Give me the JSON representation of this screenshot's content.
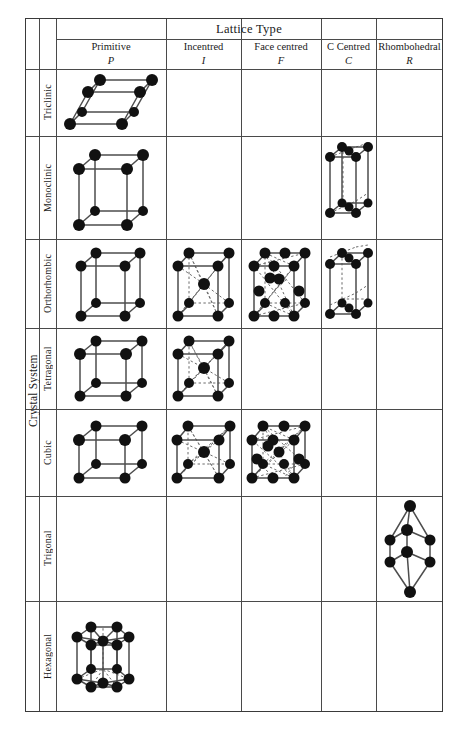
{
  "figure": {
    "header_span_label": "Lattice Type",
    "row_group_label": "Crystal System"
  },
  "columns": [
    {
      "name": "Primitive",
      "symbol": "P"
    },
    {
      "name": "Incentred",
      "symbol": "I"
    },
    {
      "name": "Face centred",
      "symbol": "F"
    },
    {
      "name": "C Centred",
      "symbol": "C"
    },
    {
      "name": "Rhombohedral",
      "symbol": "R"
    }
  ],
  "rows": [
    {
      "label": "Triclinic",
      "cells": [
        "triclinic-p",
        "",
        "",
        "",
        ""
      ]
    },
    {
      "label": "Monoclinic",
      "cells": [
        "monoclinic-p",
        "",
        "",
        "monoclinic-c",
        ""
      ]
    },
    {
      "label": "Orthorhombic",
      "cells": [
        "orthorhombic-p",
        "orthorhombic-i",
        "orthorhombic-f",
        "orthorhombic-c",
        ""
      ]
    },
    {
      "label": "Tetragonal",
      "cells": [
        "tetragonal-p",
        "tetragonal-i",
        "",
        "",
        ""
      ]
    },
    {
      "label": "Cubic",
      "cells": [
        "cubic-p",
        "cubic-i",
        "cubic-f",
        "",
        ""
      ]
    },
    {
      "label": "Trigonal",
      "cells": [
        "",
        "",
        "",
        "",
        "trigonal-r"
      ]
    },
    {
      "label": "Hexagonal",
      "cells": [
        "hexagonal-p",
        "",
        "",
        "",
        ""
      ]
    }
  ],
  "colors": {
    "border": "#3a3a3a",
    "grid": "#4a4a4a",
    "atom": "#111111",
    "edge": "#4d4d4d",
    "hidden_edge": "#6b6b6b",
    "background": "#ffffff"
  }
}
